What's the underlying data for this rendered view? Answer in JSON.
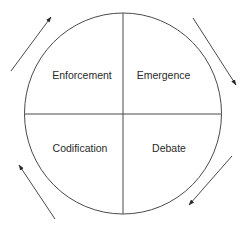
{
  "diagram": {
    "type": "cycle",
    "quadrants": [
      {
        "id": "top-left",
        "label": "Enforcement"
      },
      {
        "id": "top-right",
        "label": "Emergence"
      },
      {
        "id": "bottom-right",
        "label": "Debate"
      },
      {
        "id": "bottom-left",
        "label": "Codification"
      }
    ],
    "flow_direction": "clockwise",
    "arrows": [
      {
        "position": "top-left",
        "direction": "up-right"
      },
      {
        "position": "top-right",
        "direction": "down-right"
      },
      {
        "position": "bottom-right",
        "direction": "down-left"
      },
      {
        "position": "bottom-left",
        "direction": "up-left"
      }
    ],
    "colors": {
      "stroke": "#4a4a4a",
      "text": "#2a2a2a",
      "background": "#ffffff"
    }
  }
}
